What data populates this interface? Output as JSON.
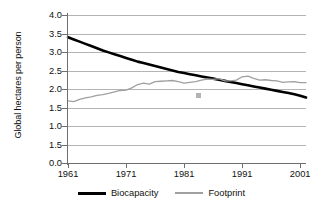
{
  "chart_data": {
    "type": "line",
    "title": "",
    "xlabel": "",
    "ylabel": "Global hectares per person",
    "xlim": [
      1961,
      2002
    ],
    "ylim": [
      0.0,
      4.0
    ],
    "grid": true,
    "legend_position": "bottom-center",
    "x_tick_labels": [
      "1961",
      "1971",
      "1981",
      "1991",
      "2001"
    ],
    "x_tick_values": [
      1961,
      1971,
      1981,
      1991,
      2001
    ],
    "y_tick_labels": [
      "4.0",
      "3.5",
      "3.0",
      "2.5",
      "2.0",
      "1.5",
      "1.0",
      "1.5",
      "0.0"
    ],
    "y_tick_values": [
      4.0,
      3.5,
      3.0,
      2.5,
      2.0,
      1.5,
      1.0,
      0.5,
      0.0
    ],
    "x": [
      1961,
      1962,
      1963,
      1964,
      1965,
      1966,
      1967,
      1968,
      1969,
      1970,
      1971,
      1972,
      1973,
      1974,
      1975,
      1976,
      1977,
      1978,
      1979,
      1980,
      1981,
      1982,
      1983,
      1984,
      1985,
      1986,
      1987,
      1988,
      1989,
      1990,
      1991,
      1992,
      1993,
      1994,
      1995,
      1996,
      1997,
      1998,
      1999,
      2000,
      2001,
      2002
    ],
    "series": [
      {
        "name": "Biocapacity",
        "color": "#000000",
        "width": 2.6,
        "values": [
          3.4,
          3.34,
          3.28,
          3.22,
          3.16,
          3.1,
          3.04,
          2.99,
          2.94,
          2.89,
          2.84,
          2.79,
          2.74,
          2.7,
          2.66,
          2.62,
          2.58,
          2.54,
          2.5,
          2.46,
          2.43,
          2.4,
          2.37,
          2.34,
          2.31,
          2.28,
          2.25,
          2.22,
          2.19,
          2.16,
          2.13,
          2.1,
          2.07,
          2.04,
          2.01,
          1.98,
          1.95,
          1.92,
          1.89,
          1.86,
          1.82,
          1.77
        ]
      },
      {
        "name": "Footprint",
        "color": "#a0a0a0",
        "width": 1.3,
        "values": [
          1.68,
          1.66,
          1.72,
          1.76,
          1.79,
          1.83,
          1.85,
          1.88,
          1.92,
          1.96,
          1.97,
          2.03,
          2.12,
          2.16,
          2.13,
          2.2,
          2.21,
          2.22,
          2.23,
          2.2,
          2.16,
          2.18,
          2.2,
          2.24,
          2.27,
          2.26,
          2.28,
          2.22,
          2.22,
          2.24,
          2.33,
          2.35,
          2.29,
          2.24,
          2.25,
          2.23,
          2.22,
          2.18,
          2.19,
          2.2,
          2.17,
          2.17
        ]
      }
    ]
  }
}
